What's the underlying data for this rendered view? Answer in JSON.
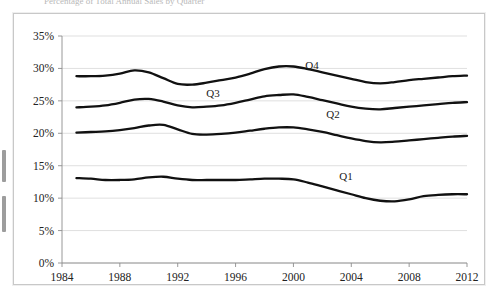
{
  "top_strip": {
    "ghost_text_1": "Percentage of Total Annual Sales by Quarter",
    "ghost_text_2": "",
    "ghost_text_3": "",
    "ghost_text_4": ""
  },
  "axes": {
    "y_ticks": [
      "0%",
      "5%",
      "10%",
      "15%",
      "20%",
      "25%",
      "30%",
      "35%"
    ],
    "x_ticks": [
      "1984",
      "1988",
      "1992",
      "1996",
      "2000",
      "2004",
      "2008",
      "2012"
    ]
  },
  "series_labels": {
    "q1": "Q1",
    "q2": "Q2",
    "q3": "Q3",
    "q4": "Q4"
  },
  "colors": {
    "line": "#111111",
    "grid": "#d7d7d7",
    "axis": "#8d8d8d",
    "frame": "#c8c8c8",
    "text": "#222222",
    "background": "#ffffff"
  },
  "chart_data": {
    "type": "line",
    "title": "",
    "subtitle": "",
    "xlabel": "",
    "ylabel": "",
    "xlim": [
      1984,
      2012
    ],
    "ylim": [
      0,
      35
    ],
    "y_unit": "percent",
    "grid": true,
    "legend_position": "inline-annotations",
    "x": [
      1985,
      1986,
      1987,
      1988,
      1989,
      1990,
      1991,
      1992,
      1993,
      1994,
      1995,
      1996,
      1997,
      1998,
      1999,
      2000,
      2001,
      2002,
      2003,
      2004,
      2005,
      2006,
      2007,
      2008,
      2009,
      2010,
      2011,
      2012
    ],
    "series": [
      {
        "name": "Q1",
        "values": [
          13.1,
          13.0,
          12.8,
          12.8,
          12.9,
          13.2,
          13.3,
          13.0,
          12.8,
          12.8,
          12.8,
          12.8,
          12.9,
          13.0,
          13.0,
          12.9,
          12.4,
          11.8,
          11.2,
          10.6,
          10.0,
          9.6,
          9.5,
          9.8,
          10.3,
          10.5,
          10.6,
          10.6
        ]
      },
      {
        "name": "Q2",
        "values": [
          20.1,
          20.2,
          20.3,
          20.5,
          20.8,
          21.2,
          21.3,
          20.6,
          19.9,
          19.8,
          19.9,
          20.1,
          20.4,
          20.7,
          20.9,
          20.9,
          20.6,
          20.2,
          19.7,
          19.2,
          18.8,
          18.6,
          18.7,
          18.9,
          19.1,
          19.3,
          19.5,
          19.6
        ]
      },
      {
        "name": "Q3",
        "values": [
          24.0,
          24.1,
          24.3,
          24.7,
          25.2,
          25.3,
          24.9,
          24.3,
          24.0,
          24.1,
          24.3,
          24.7,
          25.2,
          25.7,
          25.9,
          26.0,
          25.6,
          25.1,
          24.6,
          24.1,
          23.8,
          23.7,
          23.9,
          24.1,
          24.3,
          24.5,
          24.7,
          24.8
        ]
      },
      {
        "name": "Q4",
        "values": [
          28.8,
          28.8,
          28.9,
          29.2,
          29.7,
          29.4,
          28.5,
          27.6,
          27.5,
          27.8,
          28.2,
          28.6,
          29.2,
          29.9,
          30.3,
          30.3,
          29.9,
          29.4,
          28.9,
          28.4,
          27.9,
          27.7,
          27.9,
          28.2,
          28.4,
          28.6,
          28.8,
          28.9
        ]
      }
    ]
  }
}
